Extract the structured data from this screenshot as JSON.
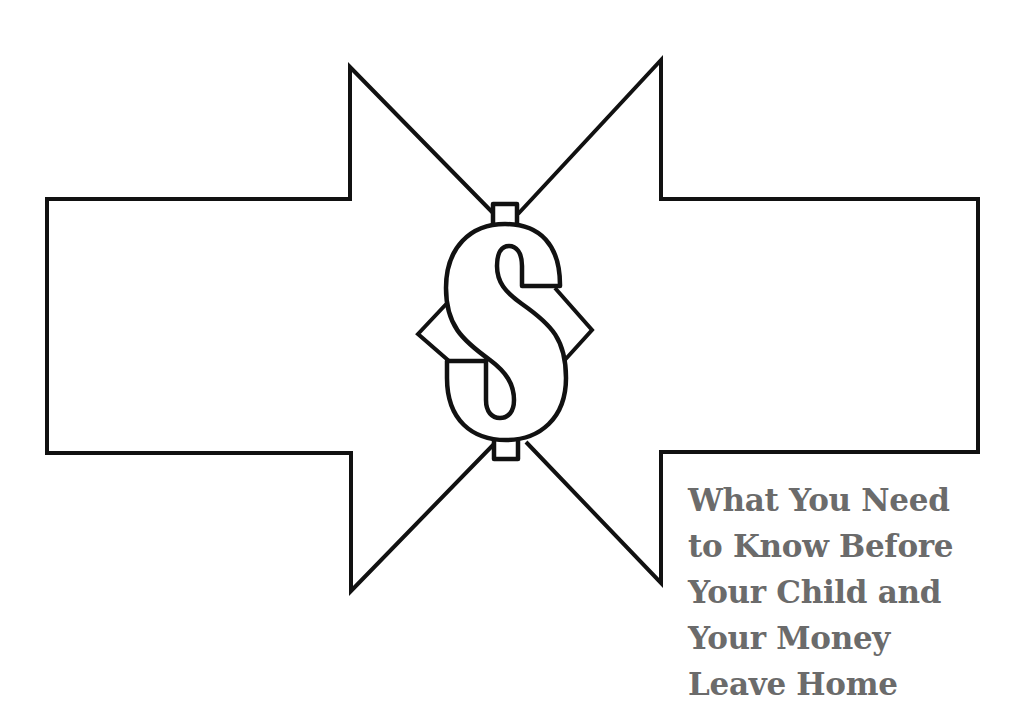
{
  "cover": {
    "title_lines": [
      "What You Need",
      "to Know Before",
      "Your Child and",
      "Your Money",
      "Leave Home"
    ],
    "icons": {
      "center": "dollar-sign-icon",
      "left": "arrow-right-icon",
      "right": "arrow-left-icon"
    },
    "colors": {
      "outline": "#111111",
      "fill": "#ffffff",
      "title_text": "#6b6b6b"
    }
  }
}
